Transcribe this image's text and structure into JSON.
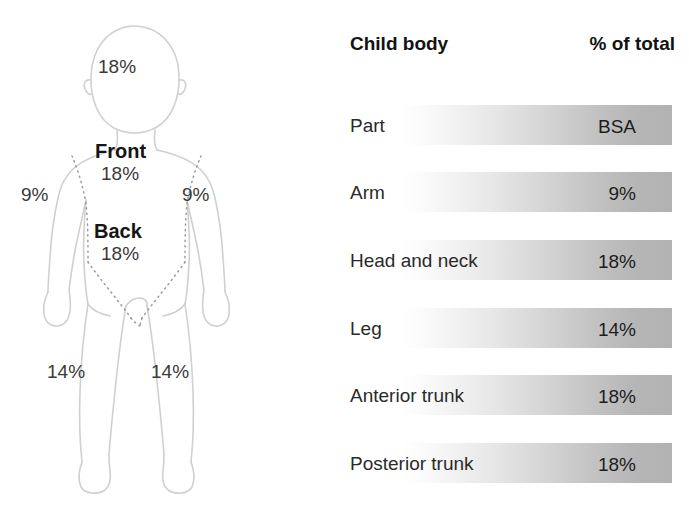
{
  "figure": {
    "labels": {
      "head": "18%",
      "front_title": "Front",
      "front_value": "18%",
      "back_title": "Back",
      "back_value": "18%",
      "arm_left": "9%",
      "arm_right": "9%",
      "leg_left": "14%",
      "leg_right": "14%"
    }
  },
  "table": {
    "header": {
      "left": "Child body",
      "right": "% of total"
    },
    "columns": [
      "Part",
      "BSA"
    ],
    "rows": [
      {
        "part": "Part",
        "value": "BSA"
      },
      {
        "part": "Arm",
        "value": "9%"
      },
      {
        "part": "Head and neck",
        "value": "18%"
      },
      {
        "part": "Leg",
        "value": "14%"
      },
      {
        "part": "Anterior trunk",
        "value": "18%"
      },
      {
        "part": "Posterior trunk",
        "value": "18%"
      }
    ]
  },
  "chart_data": {
    "type": "table",
    "columns": [
      "Child body Part",
      "% of total BSA"
    ],
    "categories": [
      "Arm",
      "Head and neck",
      "Leg",
      "Anterior trunk",
      "Posterior trunk"
    ],
    "values": [
      9,
      18,
      14,
      18,
      18
    ],
    "units": "percent",
    "annotations": [
      "Head 18%",
      "Front 18%",
      "Back 18%",
      "Arm 9% (each)",
      "Leg 14% (each)"
    ],
    "legend": "none",
    "grid": false
  },
  "colors": {
    "band_light": "#ffffff",
    "band_dark": "#b2b2b2",
    "outline": "#d2d2d2",
    "text": "#1d1d1d"
  }
}
